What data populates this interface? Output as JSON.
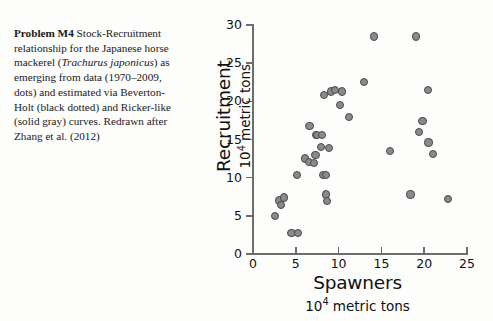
{
  "caption": {
    "lead": "Problem M4",
    "body_1": "  Stock-Recruitment relationship for the Japanese horse mackerel (",
    "species": "Trachurus japonicus",
    "body_2": ") as emerging from data (1970–2009, dots) and estimated via Beverton-Holt (black dotted) and Ricker-like (solid gray) curves. Redrawn after Zhang et al. (2012)"
  },
  "chart_data": {
    "type": "scatter",
    "title": "",
    "xlabel": "Spawners",
    "xlabel_sub": "10⁴ metric tons",
    "ylabel": "Recruitment",
    "ylabel_sub": "10⁴ metric tons",
    "xlim": [
      0,
      25
    ],
    "ylim": [
      0,
      30
    ],
    "xticks": [
      0,
      5,
      10,
      15,
      20,
      25
    ],
    "yticks": [
      0,
      5,
      10,
      15,
      20,
      25,
      30
    ],
    "grid": false,
    "legend": "none",
    "marker": {
      "fill": "#8a8a8a",
      "edge": "#4a4a4a",
      "size_px": 8.2
    },
    "axis_color": "#6d6d6d",
    "points": [
      {
        "x": 2.6,
        "y": 5.0
      },
      {
        "x": 3.1,
        "y": 7.0
      },
      {
        "x": 3.3,
        "y": 6.4
      },
      {
        "x": 3.6,
        "y": 7.4
      },
      {
        "x": 4.5,
        "y": 2.8
      },
      {
        "x": 5.3,
        "y": 2.8
      },
      {
        "x": 5.1,
        "y": 10.4
      },
      {
        "x": 6.1,
        "y": 12.5
      },
      {
        "x": 6.5,
        "y": 12.0
      },
      {
        "x": 6.6,
        "y": 16.8
      },
      {
        "x": 7.1,
        "y": 11.9
      },
      {
        "x": 7.3,
        "y": 13.0
      },
      {
        "x": 7.4,
        "y": 15.6
      },
      {
        "x": 7.5,
        "y": 15.6
      },
      {
        "x": 7.9,
        "y": 14.0
      },
      {
        "x": 8.1,
        "y": 15.6
      },
      {
        "x": 8.2,
        "y": 10.4
      },
      {
        "x": 8.5,
        "y": 10.3
      },
      {
        "x": 8.3,
        "y": 20.8
      },
      {
        "x": 8.5,
        "y": 7.8
      },
      {
        "x": 8.6,
        "y": 6.9
      },
      {
        "x": 8.9,
        "y": 13.9
      },
      {
        "x": 9.1,
        "y": 21.3
      },
      {
        "x": 9.6,
        "y": 21.5
      },
      {
        "x": 10.2,
        "y": 19.5
      },
      {
        "x": 10.4,
        "y": 21.3
      },
      {
        "x": 11.2,
        "y": 17.9
      },
      {
        "x": 13.0,
        "y": 22.5
      },
      {
        "x": 14.1,
        "y": 28.5
      },
      {
        "x": 16.0,
        "y": 13.5
      },
      {
        "x": 18.4,
        "y": 7.8
      },
      {
        "x": 19.0,
        "y": 28.5
      },
      {
        "x": 19.4,
        "y": 16.0
      },
      {
        "x": 19.8,
        "y": 17.4
      },
      {
        "x": 20.4,
        "y": 21.5
      },
      {
        "x": 20.5,
        "y": 14.6
      },
      {
        "x": 21.0,
        "y": 13.1
      },
      {
        "x": 22.8,
        "y": 7.2
      }
    ]
  }
}
